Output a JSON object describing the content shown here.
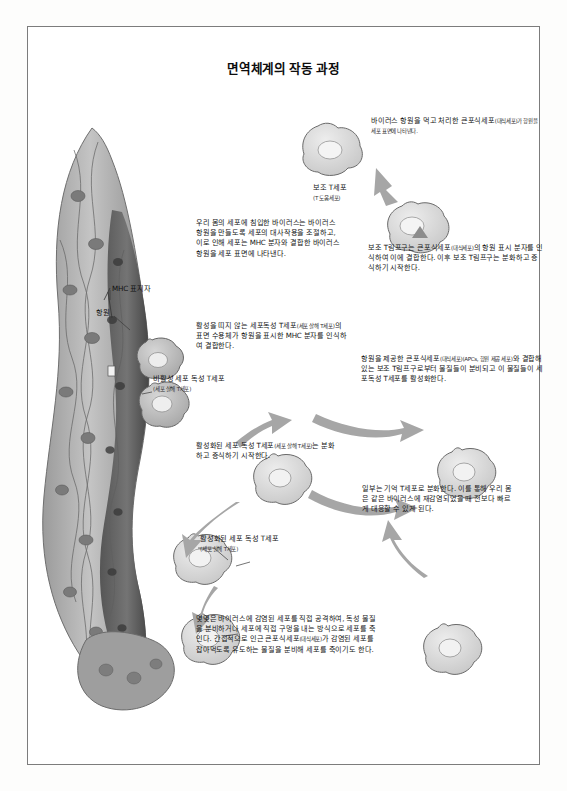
{
  "page": {
    "title": "면역체계의 작동 과정",
    "background_color": "#ffffff",
    "frame_color": "#7c7c7c"
  },
  "diagram": {
    "type": "biological-process-illustration",
    "labels": [
      {
        "id": "macrophage-antigen",
        "text": "바이러스 항원을 먹고 처리한 큰포식세포",
        "note": "(대식세포)가 항원을 세포 표면에 나타낸다."
      },
      {
        "id": "helper-t-cell",
        "text": "보조 T세포",
        "note": "(T 도움세포)"
      },
      {
        "id": "helper-t-lymphocyte-binding",
        "text": "보조 T림프구는 큰포식세포",
        "note": "(대식세포)",
        "text2": "의 항원 표시 분자를 인식하여 이에 결합한다. 이후 보조 T림프구는 분화하고 증식하기 시작한다."
      },
      {
        "id": "infected-cell",
        "text": "우리 몸의 세포에 침입한 바이러스는 바이러스 항원을 만들도록 세포의 대사작용을 조절하고, 이로 인해 세포는 MHC 분자와 결합한 바이러스 항원을 세포 표면에 나타낸다."
      },
      {
        "id": "mhc-marker",
        "text": "MHC 표지자"
      },
      {
        "id": "antigen",
        "text": "항원"
      },
      {
        "id": "inactive-cytotoxic-desc",
        "text": "활성을 띠지 않는 세포독성 T세포",
        "note": "(세포 살해 T세포)",
        "text2": "의 표면 수용체가 항원을 표시한 MHC 분자를 인식하여 결합한다."
      },
      {
        "id": "apc-activation",
        "text": "항원을 제공한 큰포식세포",
        "note": "(대식세포)(APCs, 항원 제공 세포)",
        "text2": "와 결합해 있는 보조 T림프구로부터 물질들이 분비되고 이 물질들이 세포독성 T세포를 활성화한다."
      },
      {
        "id": "inactive-cytotoxic-label",
        "text": "비활성 세포 독성 T세포",
        "note": "(세포 살해 T세포)"
      },
      {
        "id": "activated-cytotoxic-1",
        "text": "활성화된 세포 독성 T세포",
        "note": "(세포 살해 T세포)",
        "text2": "는 분화하고 증식하기 시작한다."
      },
      {
        "id": "memory-t-cell",
        "text": "일부는 기억 T세포로 분화한다. 이를 통해 우리 몸은 같은 바이러스에 재감염되었을 때 전보다 빠르게 대응할 수 있게 된다."
      },
      {
        "id": "activated-cytotoxic-2",
        "text": "활성화된 세포 독성 T세포",
        "note": "(세포 살해 T세포)"
      },
      {
        "id": "killing-mechanism",
        "text": "몇몇은 바이러스에 감염된 세포를 직접 공격하여, 독성 물질을 분비하거나 세포에 직접 구멍을 내는 방식으로 세포를 죽인다. 간접적으로 인근 큰포식세포",
        "note": "(대식세포)",
        "text2": "가 감염된 세포를 잡아먹도록 유도하는 물질을 분비해 세포를 죽이기도 한다."
      }
    ],
    "colors": {
      "tissue_fill": "#b9b9b9",
      "tissue_dark": "#6e6e6e",
      "cell_fill": "#d8d8d8",
      "cell_stroke": "#6a6a6a",
      "arrow_fill": "#a8a8a8",
      "text": "#141414"
    }
  }
}
